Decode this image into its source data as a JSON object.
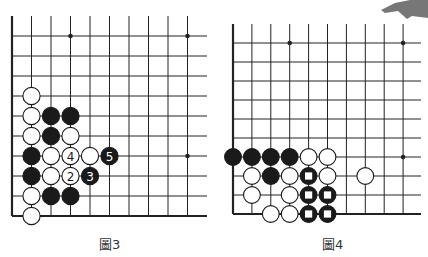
{
  "diagrams": [
    {
      "id": "board-3",
      "caption": "圖3",
      "columns": 10,
      "rows": 10,
      "star_points": [
        [
          3,
          0
        ],
        [
          9,
          0
        ],
        [
          9,
          6
        ]
      ],
      "stones": [
        {
          "col": 1,
          "row": 3,
          "color": "white"
        },
        {
          "col": 1,
          "row": 4,
          "color": "white"
        },
        {
          "col": 1,
          "row": 5,
          "color": "white"
        },
        {
          "col": 1,
          "row": 6,
          "color": "black"
        },
        {
          "col": 1,
          "row": 7,
          "color": "black"
        },
        {
          "col": 1,
          "row": 8,
          "color": "white"
        },
        {
          "col": 1,
          "row": 9,
          "color": "white"
        },
        {
          "col": 2,
          "row": 4,
          "color": "black"
        },
        {
          "col": 2,
          "row": 5,
          "color": "black"
        },
        {
          "col": 2,
          "row": 6,
          "color": "white"
        },
        {
          "col": 2,
          "row": 7,
          "color": "white"
        },
        {
          "col": 2,
          "row": 8,
          "color": "black"
        },
        {
          "col": 3,
          "row": 4,
          "color": "black"
        },
        {
          "col": 3,
          "row": 5,
          "color": "white"
        },
        {
          "col": 3,
          "row": 6,
          "color": "white",
          "label": "4"
        },
        {
          "col": 3,
          "row": 7,
          "color": "white",
          "label": "2"
        },
        {
          "col": 3,
          "row": 8,
          "color": "black"
        },
        {
          "col": 4,
          "row": 6,
          "color": "white"
        },
        {
          "col": 4,
          "row": 7,
          "color": "black",
          "label": "3"
        },
        {
          "col": 5,
          "row": 6,
          "color": "black",
          "label": "5"
        }
      ]
    },
    {
      "id": "board-4",
      "caption": "圖4",
      "columns": 10,
      "rows": 10,
      "star_points": [
        [
          3,
          0
        ],
        [
          9,
          0
        ],
        [
          9,
          6
        ]
      ],
      "stones": [
        {
          "col": 0,
          "row": 6,
          "color": "black"
        },
        {
          "col": 1,
          "row": 6,
          "color": "black"
        },
        {
          "col": 2,
          "row": 6,
          "color": "black"
        },
        {
          "col": 3,
          "row": 6,
          "color": "black"
        },
        {
          "col": 4,
          "row": 6,
          "color": "white"
        },
        {
          "col": 5,
          "row": 6,
          "color": "white"
        },
        {
          "col": 1,
          "row": 7,
          "color": "white"
        },
        {
          "col": 2,
          "row": 7,
          "color": "black"
        },
        {
          "col": 3,
          "row": 7,
          "color": "white"
        },
        {
          "col": 4,
          "row": 7,
          "color": "black",
          "mark": "square"
        },
        {
          "col": 5,
          "row": 7,
          "color": "white"
        },
        {
          "col": 7,
          "row": 7,
          "color": "white"
        },
        {
          "col": 1,
          "row": 8,
          "color": "white"
        },
        {
          "col": 3,
          "row": 8,
          "color": "white"
        },
        {
          "col": 4,
          "row": 8,
          "color": "black",
          "mark": "square"
        },
        {
          "col": 5,
          "row": 8,
          "color": "black",
          "mark": "square"
        },
        {
          "col": 2,
          "row": 9,
          "color": "white"
        },
        {
          "col": 3,
          "row": 9,
          "color": "white"
        },
        {
          "col": 4,
          "row": 9,
          "color": "black",
          "mark": "square"
        },
        {
          "col": 5,
          "row": 9,
          "color": "black",
          "mark": "square"
        }
      ]
    }
  ]
}
